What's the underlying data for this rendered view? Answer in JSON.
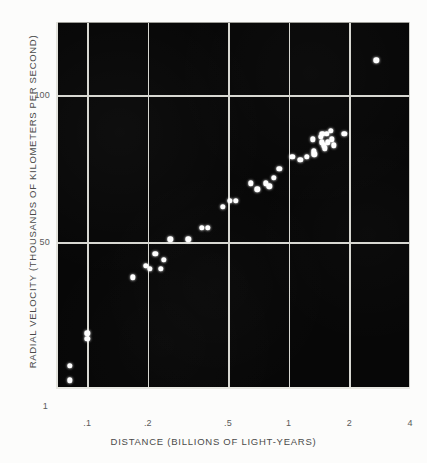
{
  "figure": {
    "kind": "scatter-plot",
    "background_color": "#fcfcfb",
    "panel_color": "#070707",
    "grid_color": "#d8d8d2",
    "point_color": "#ffffff"
  },
  "chart_data": {
    "type": "scatter",
    "title": "",
    "xlabel": "DISTANCE (BILLIONS OF LIGHT-YEARS)",
    "ylabel": "RADIAL VELOCITY (THOUSANDS OF KILOMETERS PER SECOND)",
    "xscale": "log",
    "yscale": "linear",
    "xlim": [
      0.07,
      4
    ],
    "ylim": [
      0,
      125
    ],
    "xticks": [
      0.1,
      0.2,
      0.5,
      1,
      2,
      4
    ],
    "xticklabels": [
      ".1",
      ".2",
      ".5",
      "1",
      "2",
      "4"
    ],
    "yticks": [
      50,
      100
    ],
    "yticklabels": [
      "50",
      "100"
    ],
    "extra_ticklabels": [
      {
        "axis": "y",
        "label": "1",
        "note": "origin marker at lower-left of axes"
      }
    ],
    "grid": true,
    "legend": null,
    "points": [
      {
        "x": 0.082,
        "y": 8
      },
      {
        "x": 0.082,
        "y": 3
      },
      {
        "x": 0.1,
        "y": 17
      },
      {
        "x": 0.1,
        "y": 19
      },
      {
        "x": 0.168,
        "y": 38
      },
      {
        "x": 0.196,
        "y": 42
      },
      {
        "x": 0.204,
        "y": 41
      },
      {
        "x": 0.218,
        "y": 46
      },
      {
        "x": 0.232,
        "y": 41
      },
      {
        "x": 0.24,
        "y": 44
      },
      {
        "x": 0.258,
        "y": 51
      },
      {
        "x": 0.318,
        "y": 51
      },
      {
        "x": 0.37,
        "y": 55
      },
      {
        "x": 0.398,
        "y": 55
      },
      {
        "x": 0.47,
        "y": 62
      },
      {
        "x": 0.51,
        "y": 64
      },
      {
        "x": 0.545,
        "y": 64
      },
      {
        "x": 0.65,
        "y": 70
      },
      {
        "x": 0.7,
        "y": 68
      },
      {
        "x": 0.77,
        "y": 70
      },
      {
        "x": 0.8,
        "y": 69
      },
      {
        "x": 0.845,
        "y": 72
      },
      {
        "x": 0.9,
        "y": 75
      },
      {
        "x": 1.04,
        "y": 79
      },
      {
        "x": 1.14,
        "y": 78
      },
      {
        "x": 1.23,
        "y": 79
      },
      {
        "x": 1.32,
        "y": 85
      },
      {
        "x": 1.33,
        "y": 81
      },
      {
        "x": 1.34,
        "y": 80
      },
      {
        "x": 1.44,
        "y": 86
      },
      {
        "x": 1.46,
        "y": 84
      },
      {
        "x": 1.47,
        "y": 87
      },
      {
        "x": 1.49,
        "y": 83
      },
      {
        "x": 1.51,
        "y": 82
      },
      {
        "x": 1.545,
        "y": 87
      },
      {
        "x": 1.56,
        "y": 84
      },
      {
        "x": 1.62,
        "y": 88
      },
      {
        "x": 1.64,
        "y": 85
      },
      {
        "x": 1.68,
        "y": 83
      },
      {
        "x": 1.89,
        "y": 87
      },
      {
        "x": 2.72,
        "y": 112
      }
    ]
  }
}
